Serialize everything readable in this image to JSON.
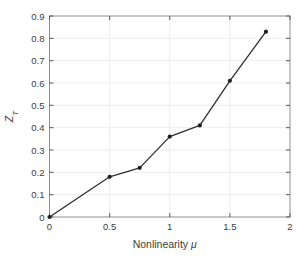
{
  "page": {
    "background": "#ffffff"
  },
  "chart_data": {
    "type": "line",
    "title": "",
    "xlabel": "Nonlinearity μ",
    "xlabel_text": "Nonlinearity",
    "xlabel_symbol": "μ",
    "ylabel": "Z_T",
    "ylabel_letter": "Z",
    "ylabel_subscript": "T",
    "x": [
      0,
      0.5,
      0.75,
      1,
      1.25,
      1.5,
      1.8
    ],
    "y": [
      0,
      0.18,
      0.22,
      0.36,
      0.41,
      0.61,
      0.83
    ],
    "xlim": [
      0,
      2
    ],
    "ylim": [
      0,
      0.9
    ],
    "xticks": [
      0,
      0.5,
      1,
      1.5,
      2
    ],
    "xtick_labels": [
      "0",
      "0.5",
      "1",
      "1.5",
      "2"
    ],
    "yticks": [
      0,
      0.1,
      0.2,
      0.3,
      0.4,
      0.5,
      0.6,
      0.7,
      0.8,
      0.9
    ],
    "ytick_labels": [
      "0",
      "0.1",
      "0.2",
      "0.3",
      "0.4",
      "0.5",
      "0.6",
      "0.7",
      "0.8",
      "0.9"
    ],
    "grid": true,
    "marker": "dot",
    "colors": {
      "line": "#2e2e2e",
      "marker": "#1f1f1f",
      "axis_box": "#8f8f8f",
      "tick": "#5a5a5a",
      "grid": "#efedec",
      "tick_label": "#3c3c3c",
      "axis_label": "#3c3c3c"
    }
  }
}
